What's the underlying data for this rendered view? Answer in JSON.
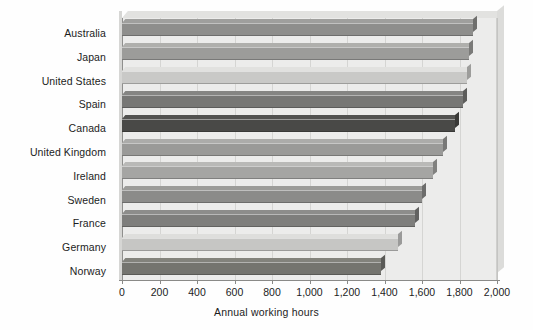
{
  "chart_data": {
    "type": "bar",
    "orientation": "horizontal",
    "title": "",
    "subtitle": "",
    "xlabel": "Annual working hours",
    "ylabel": "",
    "categories": [
      "Australia",
      "Japan",
      "United States",
      "Spain",
      "Canada",
      "United Kingdom",
      "Ireland",
      "Sweden",
      "France",
      "Germany",
      "Norway"
    ],
    "values": [
      1870,
      1850,
      1840,
      1820,
      1775,
      1710,
      1660,
      1600,
      1565,
      1470,
      1380
    ],
    "bar_colors": [
      "#8e8e8c",
      "#9c9c9a",
      "#c9c9c7",
      "#777775",
      "#494947",
      "#9a9a98",
      "#a5a5a3",
      "#8b8b89",
      "#7e7e7c",
      "#c6c6c4",
      "#74746f"
    ],
    "xlim": [
      0,
      2000
    ],
    "xticks": [
      0,
      200,
      400,
      600,
      800,
      1000,
      1200,
      1400,
      1600,
      1800,
      2000
    ],
    "xtick_labels": [
      "0",
      "200",
      "400",
      "600",
      "800",
      "1,000",
      "1,200",
      "1,400",
      "1,600",
      "1,800",
      "2,000"
    ],
    "grid": true,
    "grid_axis": "x",
    "legend": false,
    "legend_position": "none",
    "plot_style": "3d-shaded",
    "background_color": "#ececeb",
    "axis_color": "#8a8a88",
    "gridline_color": "#d5d5d3",
    "text_color": "#1c1c1c"
  }
}
